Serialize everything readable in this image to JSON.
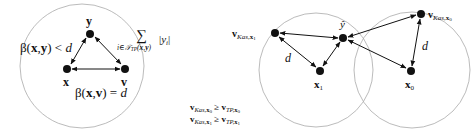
{
  "left_panel": {
    "nodes": {
      "y": {
        "label": "y",
        "cx": 90,
        "cy": 34
      },
      "x": {
        "label": "x",
        "cx": 67,
        "cy": 69
      },
      "v": {
        "label": "v",
        "cx": 125,
        "cy": 69
      }
    },
    "circle": {
      "cx": 82,
      "cy": 66,
      "r": 62
    },
    "annotations": {
      "beta_xy": "β(x,y) < d",
      "sum_symbol": "∑",
      "sum_subscript": "i∈T_TP(x,y)",
      "sum_term": "|y_i|",
      "beta_xv": "β(x,v) = d"
    }
  },
  "right_panel": {
    "nodes": {
      "v_kas_x1": {
        "label": "v_Kas,x1",
        "cx": 275,
        "cy": 33
      },
      "y_hat": {
        "label": "ŷ",
        "cx": 343,
        "cy": 38
      },
      "x1": {
        "label": "x1",
        "cx": 320,
        "cy": 71
      },
      "v_kas_x0": {
        "label": "v_Kas,x0",
        "cx": 421,
        "cy": 14
      },
      "x0": {
        "label": "x0",
        "cx": 411,
        "cy": 71
      }
    },
    "circles": [
      {
        "cx": 316,
        "cy": 70,
        "r": 57
      },
      {
        "cx": 412,
        "cy": 70,
        "r": 58
      }
    ],
    "edge_labels": {
      "d_left": "d",
      "d_right": "d"
    },
    "inequalities": [
      "v_Kas,x0 ≥ v_TP,x0",
      "v_Kas,x1 ≥ v_TP,x1"
    ]
  }
}
